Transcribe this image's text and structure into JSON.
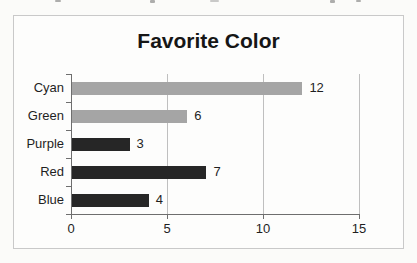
{
  "chart_data": {
    "type": "bar",
    "orientation": "horizontal",
    "title": "Favorite Color",
    "categories": [
      "Cyan",
      "Green",
      "Purple",
      "Red",
      "Blue"
    ],
    "values": [
      12,
      6,
      3,
      7,
      4
    ],
    "data_labels": [
      "12",
      "6",
      "3",
      "7",
      "4"
    ],
    "xlabel": "",
    "ylabel": "",
    "xlim": [
      0,
      15
    ],
    "xticks": [
      0,
      5,
      10,
      15
    ],
    "grid": "vertical",
    "legend": "none",
    "bar_colors": [
      "#a5a5a5",
      "#a5a5a5",
      "#262626",
      "#262626",
      "#262626"
    ],
    "styles": {
      "axis_color": "#6e6e6e",
      "grid_color": "#bfbfbf",
      "text_color": "#1f1f1f",
      "title_color": "#161616",
      "frame_border_color": "#c9c9c9",
      "background_color": "#fbfbf9"
    }
  }
}
